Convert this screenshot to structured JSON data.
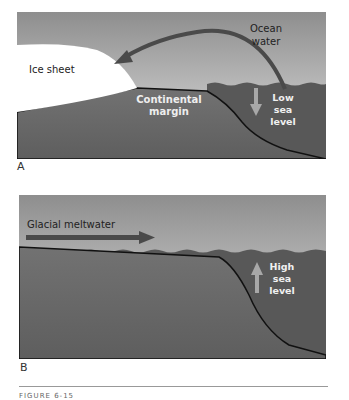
{
  "figure": {
    "caption": "FIGURE 6-15",
    "panels": [
      {
        "id": "A",
        "label": "A",
        "annotations": {
          "ice_sheet": "Ice sheet",
          "ocean_water_line1": "Ocean",
          "ocean_water_line2": "water",
          "continental_margin_line1": "Continental",
          "continental_margin_line2": "margin",
          "sea_level_line1": "Low",
          "sea_level_line2": "sea",
          "sea_level_line3": "level"
        },
        "arrows": [
          {
            "name": "ocean-water-to-ice-arrow",
            "direction": "curved-left"
          },
          {
            "name": "sea-level-down-arrow",
            "direction": "down"
          }
        ]
      },
      {
        "id": "B",
        "label": "B",
        "annotations": {
          "glacial_meltwater": "Glacial meltwater",
          "sea_level_line1": "High",
          "sea_level_line2": "sea",
          "sea_level_line3": "level"
        },
        "arrows": [
          {
            "name": "meltwater-right-arrow",
            "direction": "right"
          },
          {
            "name": "sea-level-up-arrow",
            "direction": "up"
          }
        ]
      }
    ],
    "colors": {
      "sky_top": "#8f8f8f",
      "sky_bottom": "#dcdcdc",
      "land": "#6a6a6a",
      "sea": "#585858",
      "ice": "#ffffff",
      "arrow_dark": "#4a4a4a",
      "arrow_light": "#a8a8a8"
    }
  }
}
